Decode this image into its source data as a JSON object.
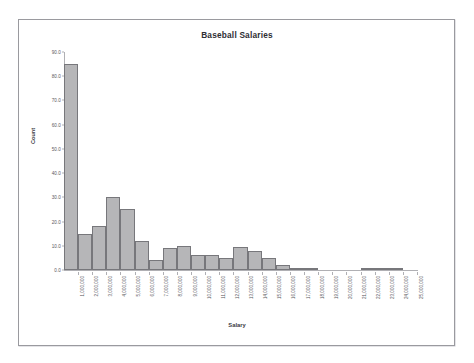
{
  "document": {
    "frame_present": true,
    "background_color": "#ffffff",
    "border_color": "#9a9a9f"
  },
  "chart_data": {
    "type": "bar",
    "title": "Baseball Salaries",
    "xlabel": "Salary",
    "ylabel": "Count",
    "grid": false,
    "legend": null,
    "ylim": [
      0,
      90
    ],
    "ytick_labels": [
      "0.0",
      "10.0",
      "20.0",
      "30.0",
      "40.0",
      "50.0",
      "60.0",
      "70.0",
      "80.0",
      "90.0"
    ],
    "ytick_values": [
      0,
      10,
      20,
      30,
      40,
      50,
      60,
      70,
      80,
      90
    ],
    "categories": [
      "1,000,000",
      "2,000,000",
      "3,000,000",
      "4,000,000",
      "5,000,000",
      "6,000,000",
      "7,000,000",
      "8,000,000",
      "9,000,000",
      "10,000,000",
      "11,000,000",
      "12,000,000",
      "13,000,000",
      "14,000,000",
      "15,000,000",
      "16,000,000",
      "17,000,000",
      "18,000,000",
      "19,000,000",
      "20,000,000",
      "21,000,000",
      "22,000,000",
      "23,000,000",
      "24,000,000",
      "25,000,000"
    ],
    "values": [
      85,
      15,
      18,
      30,
      25,
      12,
      4,
      9,
      10,
      6,
      6,
      5,
      9.5,
      8,
      5,
      2,
      1,
      1,
      0,
      0,
      0,
      1,
      1,
      1,
      0
    ],
    "bar_fill_color": "#b6b6b8",
    "bar_border_color": "#77777b",
    "axis_color": "#b0b0b4"
  }
}
